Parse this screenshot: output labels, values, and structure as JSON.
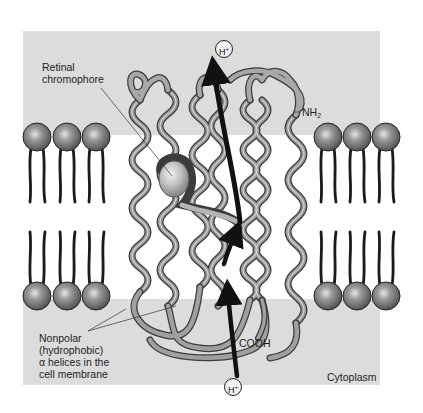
{
  "diagram": {
    "labels": {
      "retinal": [
        "Retinal",
        "chromophore"
      ],
      "nonpolar": [
        "Nonpolar",
        "(hydrophobic)",
        "α helices in the",
        "cell membrane"
      ],
      "nh2_base": "NH",
      "nh2_sub": "2",
      "cooh": "COOH",
      "cytoplasm": "Cytoplasm",
      "proton_top": "H",
      "proton_bottom": "H",
      "proton_charge": "+"
    },
    "regions": {
      "extracellular_band": "gray",
      "membrane_core": "white",
      "cytoplasm_band": "gray"
    },
    "elements": {
      "helix_count": 7,
      "phospholipids_left_per_layer": 3,
      "phospholipids_right_per_layer": 3,
      "proton_path_arrows": 3
    },
    "colors": {
      "background": "#ffffff",
      "aqueous_gray": "#dcdcdc",
      "helix_tube": "#8a8a8a",
      "helix_highlight": "#c8c8c8",
      "helix_outline": "#3c3c3c",
      "lipid_head": "#7a7a7a",
      "lipid_tail": "#1a1a1a",
      "arrow": "#111111",
      "text": "#1e1e1e"
    }
  }
}
